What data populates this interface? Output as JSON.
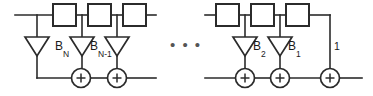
{
  "diagram": {
    "colors": {
      "line": "#2b2b2b",
      "fill": "#ffffff",
      "text": "#1a1a1a",
      "ellipsis": "#555555"
    },
    "ellipsis": "• • •",
    "left_section": {
      "delay_boxes": [
        {
          "name": "delay-box-1",
          "label": ""
        },
        {
          "name": "delay-box-2",
          "label": ""
        },
        {
          "name": "delay-box-3",
          "label": ""
        }
      ],
      "gain_taps": [
        {
          "name": "gain-tap-bn",
          "base": "B",
          "sub": "N"
        },
        {
          "name": "gain-tap-bn-minus-1",
          "base": "B",
          "sub": "N-1"
        }
      ],
      "adders": [
        {
          "name": "adder-1",
          "symbol": "+"
        },
        {
          "name": "adder-2",
          "symbol": "+"
        }
      ]
    },
    "right_section": {
      "delay_boxes": [
        {
          "name": "delay-box-4",
          "label": ""
        },
        {
          "name": "delay-box-5",
          "label": ""
        },
        {
          "name": "delay-box-6",
          "label": ""
        }
      ],
      "gain_taps": [
        {
          "name": "gain-tap-b2",
          "base": "B",
          "sub": "2"
        },
        {
          "name": "gain-tap-b1",
          "base": "B",
          "sub": "1"
        }
      ],
      "unity_tap": {
        "name": "unity-tap",
        "label": "1"
      },
      "adders": [
        {
          "name": "adder-3",
          "symbol": "+"
        },
        {
          "name": "adder-4",
          "symbol": "+"
        },
        {
          "name": "adder-5",
          "symbol": "+"
        }
      ]
    }
  }
}
